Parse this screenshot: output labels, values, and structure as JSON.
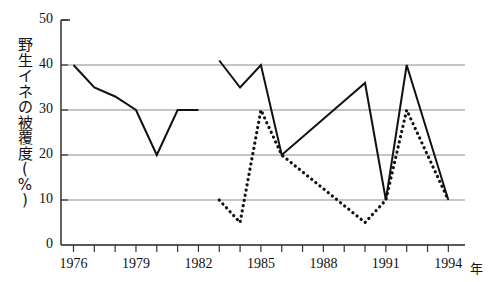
{
  "chart_data": {
    "type": "line",
    "title": "",
    "xlabel": "年",
    "ylabel": "野生イネの被覆度（%）",
    "ylabel_chars": [
      "野",
      "生",
      "イ",
      "ネ",
      "の",
      "被",
      "覆",
      "度",
      "(",
      "%",
      ")"
    ],
    "xlim": [
      1975.4,
      1994.8
    ],
    "ylim": [
      0,
      50
    ],
    "grid": true,
    "grid_axis": "y",
    "legend": "none",
    "y_ticks": [
      0,
      10,
      20,
      30,
      40,
      50
    ],
    "x_ticks": [
      1976,
      1977,
      1978,
      1979,
      1980,
      1981,
      1982,
      1983,
      1984,
      1985,
      1986,
      1987,
      1988,
      1989,
      1990,
      1991,
      1992,
      1993,
      1994
    ],
    "x_tick_labels": [
      "1976",
      "",
      "",
      "1979",
      "",
      "",
      "1982",
      "",
      "",
      "1985",
      "",
      "",
      "1988",
      "",
      "",
      "1991",
      "",
      "",
      "1994"
    ],
    "series": [
      {
        "name": "solid-segment-1",
        "style": "solid",
        "color": "#111111",
        "x": [
          1976,
          1977,
          1978,
          1979,
          1980,
          1981,
          1982
        ],
        "values": [
          40,
          35,
          33,
          30,
          20,
          30,
          30
        ]
      },
      {
        "name": "solid-segment-2",
        "style": "solid",
        "color": "#111111",
        "x": [
          1983,
          1984,
          1985,
          1986,
          1990,
          1991,
          1992,
          1994
        ],
        "values": [
          41,
          35,
          40,
          20,
          36,
          10,
          40,
          10
        ]
      },
      {
        "name": "dotted-segment",
        "style": "dotted",
        "color": "#111111",
        "x": [
          1983,
          1984,
          1985,
          1986,
          1990,
          1991,
          1992,
          1994
        ],
        "values": [
          10,
          5,
          30,
          20,
          5,
          10,
          30,
          10
        ]
      }
    ]
  },
  "axis": {
    "y_tick_labels": [
      "50",
      "40",
      "30",
      "20",
      "10",
      "0"
    ],
    "x_tick_labels_shown": [
      "1976",
      "1979",
      "1982",
      "1985",
      "1988",
      "1991",
      "1994"
    ],
    "x_unit": "年"
  }
}
